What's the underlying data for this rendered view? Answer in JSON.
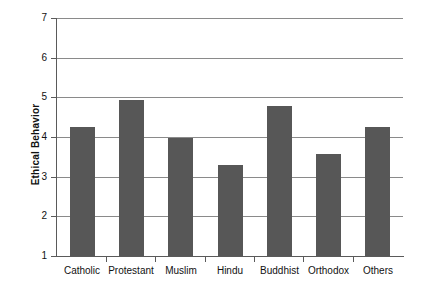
{
  "chart_data": {
    "type": "bar",
    "title": "",
    "xlabel": "",
    "ylabel": "Ethical Behavior",
    "categories": [
      "Catholic",
      "Protestant",
      "Muslim",
      "Hindu",
      "Buddhist",
      "Orthodox",
      "Others"
    ],
    "values": [
      4.25,
      4.93,
      3.97,
      3.3,
      4.78,
      3.57,
      4.25
    ],
    "ylim": [
      1,
      7
    ],
    "yticks": [
      1,
      2,
      3,
      4,
      5,
      6,
      7
    ],
    "ytick_labels": [
      "1",
      "2",
      "3",
      "4",
      "5",
      "6",
      "7"
    ],
    "grid": true,
    "grid_axis": "y",
    "legend": false,
    "legend_position": "none",
    "bar_color": "#575757",
    "gridline_color": "#8a8a8a",
    "axis_color": "#5a5a5a",
    "background_color": "#ffffff"
  },
  "yticks": {
    "t1": "1",
    "t2": "2",
    "t3": "3",
    "t4": "4",
    "t5": "5",
    "t6": "6",
    "t7": "7"
  },
  "xticks": {
    "c0": "Catholic",
    "c1": "Protestant",
    "c2": "Muslim",
    "c3": "Hindu",
    "c4": "Buddhist",
    "c5": "Orthodox",
    "c6": "Others"
  },
  "axis_titles": {
    "y": "Ethical Behavior"
  }
}
